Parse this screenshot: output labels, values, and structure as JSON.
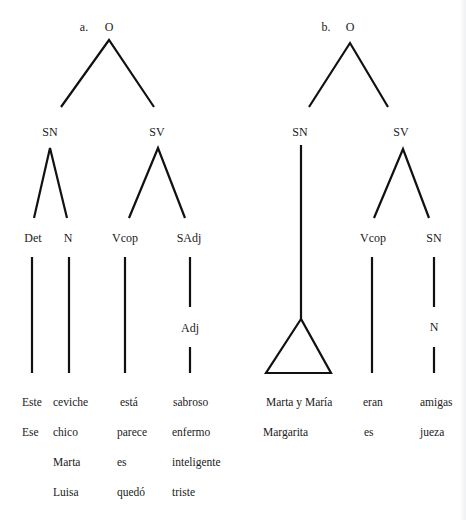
{
  "tree_a": {
    "marker": "a.",
    "root": "O",
    "sn": "SN",
    "sv": "SV",
    "det": "Det",
    "n": "N",
    "vcop": "Vcop",
    "sadj": "SAdj",
    "adj": "Adj",
    "columns": {
      "det": [
        "Este",
        "Ese"
      ],
      "n": [
        "ceviche",
        "chico",
        "Marta",
        "Luisa"
      ],
      "vcop": [
        "está",
        "parece",
        "es",
        "quedó"
      ],
      "adj": [
        "sabroso",
        "enfermo",
        "inteligente",
        "triste"
      ]
    }
  },
  "tree_b": {
    "marker": "b.",
    "root": "O",
    "sn": "SN",
    "sv": "SV",
    "vcop": "Vcop",
    "sn2": "SN",
    "n": "N",
    "columns": {
      "sn": [
        "Marta y María",
        "Margarita"
      ],
      "vcop": [
        "eran",
        "es"
      ],
      "n": [
        "amigas",
        "jueza"
      ]
    }
  }
}
